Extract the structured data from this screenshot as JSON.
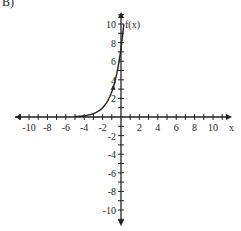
{
  "problem_label": "B)",
  "chart_data": {
    "type": "line",
    "title": "",
    "xlabel": "x",
    "ylabel": "f(x)",
    "xlim": [
      -11,
      11
    ],
    "ylim": [
      -11,
      11
    ],
    "x_ticks": [
      -10,
      -8,
      -6,
      -4,
      -2,
      2,
      4,
      6,
      8,
      10
    ],
    "y_ticks": [
      -10,
      -8,
      -6,
      -4,
      -2,
      2,
      4,
      6,
      8,
      10
    ],
    "grid": false,
    "series": [
      {
        "name": "f(x)",
        "function": "exponential",
        "x": [
          -6,
          -5,
          -4,
          -3,
          -2,
          -1.5,
          -1,
          -0.5,
          0,
          0.3
        ],
        "values": [
          0.02,
          0.05,
          0.14,
          0.37,
          1.0,
          1.65,
          2.72,
          4.48,
          7.39,
          10.0
        ]
      }
    ],
    "color": "#222222"
  }
}
